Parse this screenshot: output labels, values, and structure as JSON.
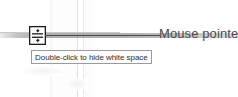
{
  "canvas": {
    "width": 238,
    "height": 97,
    "background_color": "#ffffff"
  },
  "annotation": {
    "label": "Mouse pointer",
    "label_color": "#4b4b4b",
    "leader_line_color": "#4a4a4a"
  },
  "cursor": {
    "icon_name": "hide-white-space-cursor",
    "description": "Two arrows pointing toward horizontal bars",
    "border_color": "#1d1d1d",
    "fill_color": "#ffffff"
  },
  "tooltip": {
    "text": "Double-click to hide white space",
    "border_color": "#9b9b9b",
    "background_color": "#fdfdfd",
    "text_color": "#2f2f2f"
  },
  "document_background": {
    "page_gap_band_color": "#6e6e6e",
    "page_edge_color": "#e2e2e2"
  }
}
